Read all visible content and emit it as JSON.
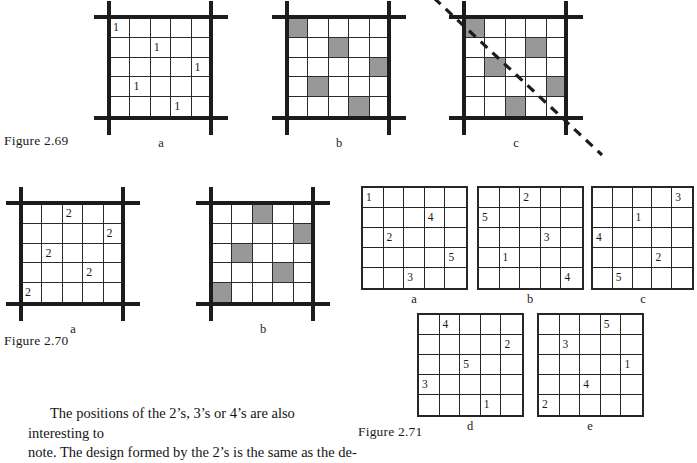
{
  "page": {
    "width": 697,
    "height": 445,
    "background": "#ffffff",
    "shade_color": "#989898",
    "ink_color": "#1c1c1c"
  },
  "figures": [
    {
      "id": "figure-2-69",
      "caption": "Figure 2.69",
      "panels": [
        {
          "letter": "a",
          "style": "numbers",
          "marks": [
            {
              "row": 1,
              "col": 1,
              "value": "1"
            },
            {
              "row": 2,
              "col": 3,
              "value": "1"
            },
            {
              "row": 3,
              "col": 5,
              "value": "1"
            },
            {
              "row": 4,
              "col": 2,
              "value": "1"
            },
            {
              "row": 5,
              "col": 4,
              "value": "1"
            }
          ]
        },
        {
          "letter": "b",
          "style": "shaded",
          "marks": [
            {
              "row": 1,
              "col": 1
            },
            {
              "row": 2,
              "col": 3
            },
            {
              "row": 3,
              "col": 5
            },
            {
              "row": 4,
              "col": 2
            },
            {
              "row": 5,
              "col": 4
            }
          ]
        },
        {
          "letter": "c",
          "style": "shaded",
          "diagonal": "dashed-descending",
          "marks": [
            {
              "row": 1,
              "col": 1
            },
            {
              "row": 2,
              "col": 4
            },
            {
              "row": 3,
              "col": 2
            },
            {
              "row": 4,
              "col": 5
            },
            {
              "row": 5,
              "col": 3
            }
          ]
        }
      ]
    },
    {
      "id": "figure-2-70",
      "caption": "Figure 2.70",
      "panels": [
        {
          "letter": "a",
          "style": "numbers",
          "marks": [
            {
              "row": 1,
              "col": 3,
              "value": "2"
            },
            {
              "row": 2,
              "col": 5,
              "value": "2"
            },
            {
              "row": 3,
              "col": 2,
              "value": "2"
            },
            {
              "row": 4,
              "col": 4,
              "value": "2"
            },
            {
              "row": 5,
              "col": 1,
              "value": "2"
            }
          ]
        },
        {
          "letter": "b",
          "style": "shaded",
          "marks": [
            {
              "row": 1,
              "col": 3
            },
            {
              "row": 2,
              "col": 5
            },
            {
              "row": 3,
              "col": 2
            },
            {
              "row": 4,
              "col": 4
            },
            {
              "row": 5,
              "col": 1
            }
          ]
        }
      ]
    },
    {
      "id": "figure-2-71",
      "caption": "Figure 2.71",
      "panels": [
        {
          "letter": "a",
          "style": "numbers",
          "marks": [
            {
              "row": 1,
              "col": 1,
              "value": "1"
            },
            {
              "row": 2,
              "col": 4,
              "value": "4"
            },
            {
              "row": 3,
              "col": 2,
              "value": "2"
            },
            {
              "row": 4,
              "col": 5,
              "value": "5"
            },
            {
              "row": 5,
              "col": 3,
              "value": "3"
            }
          ]
        },
        {
          "letter": "b",
          "style": "numbers",
          "marks": [
            {
              "row": 1,
              "col": 3,
              "value": "2"
            },
            {
              "row": 2,
              "col": 1,
              "value": "5"
            },
            {
              "row": 3,
              "col": 4,
              "value": "3"
            },
            {
              "row": 4,
              "col": 2,
              "value": "1"
            },
            {
              "row": 5,
              "col": 5,
              "value": "4"
            }
          ]
        },
        {
          "letter": "c",
          "style": "numbers",
          "marks": [
            {
              "row": 1,
              "col": 5,
              "value": "3"
            },
            {
              "row": 2,
              "col": 3,
              "value": "1"
            },
            {
              "row": 3,
              "col": 1,
              "value": "4"
            },
            {
              "row": 4,
              "col": 4,
              "value": "2"
            },
            {
              "row": 5,
              "col": 2,
              "value": "5"
            }
          ]
        },
        {
          "letter": "d",
          "style": "numbers",
          "marks": [
            {
              "row": 1,
              "col": 2,
              "value": "4"
            },
            {
              "row": 2,
              "col": 5,
              "value": "2"
            },
            {
              "row": 3,
              "col": 3,
              "value": "5"
            },
            {
              "row": 4,
              "col": 1,
              "value": "3"
            },
            {
              "row": 5,
              "col": 4,
              "value": "1"
            }
          ]
        },
        {
          "letter": "e",
          "style": "numbers",
          "marks": [
            {
              "row": 1,
              "col": 4,
              "value": "5"
            },
            {
              "row": 2,
              "col": 2,
              "value": "3"
            },
            {
              "row": 3,
              "col": 5,
              "value": "1"
            },
            {
              "row": 4,
              "col": 3,
              "value": "4"
            },
            {
              "row": 5,
              "col": 1,
              "value": "2"
            }
          ]
        }
      ]
    }
  ],
  "body": {
    "line1": "The positions of the 2’s, 3’s or 4’s are also interesting to",
    "line2": "note. The design formed by the 2’s is the same as the de-"
  }
}
